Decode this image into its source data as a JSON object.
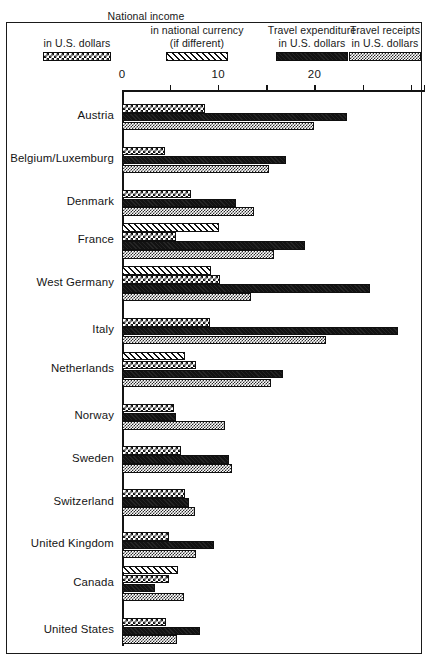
{
  "legend": [
    {
      "line1": "",
      "line2": "in U.S. dollars",
      "swatch": "income-swatch"
    },
    {
      "line1": "in national currency",
      "line2": "(if different)",
      "swatch": "currency-swatch"
    },
    {
      "line1": "Travel expenditure",
      "line2": "in U.S. dollars",
      "swatch": "expenditure-swatch"
    },
    {
      "line1": "Travel receipts",
      "line2": "in U.S. dollars",
      "swatch": "receipts-swatch"
    }
  ],
  "legend_title": "National income",
  "chart_data": {
    "type": "bar",
    "orientation": "horizontal",
    "title": "National income",
    "xlabel": "",
    "ylabel": "",
    "xlim": [
      0,
      31.5
    ],
    "grid": false,
    "legend_position": "top",
    "ticks": [
      0,
      5,
      10,
      15,
      20,
      25,
      30
    ],
    "tick_labels": [
      "0",
      "",
      "10",
      "",
      "20",
      "",
      ""
    ],
    "series": [
      {
        "name": "National income in U.S. dollars",
        "key": "income",
        "pattern": "checker-coarse"
      },
      {
        "name": "National income in national currency (if different)",
        "key": "currency",
        "pattern": "diagonal-hatch"
      },
      {
        "name": "Travel expenditure in U.S. dollars",
        "key": "expenditure",
        "pattern": "solid-black"
      },
      {
        "name": "Travel receipts in U.S. dollars",
        "key": "receipts",
        "pattern": "checker-fine"
      }
    ],
    "categories": [
      "Austria",
      "Belgium/Luxemburg",
      "Denmark",
      "France",
      "West Germany",
      "Italy",
      "Netherlands",
      "Norway",
      "Sweden",
      "Switzerland",
      "United Kingdom",
      "Canada",
      "United States"
    ],
    "rows": [
      {
        "category": "Austria",
        "currency": null,
        "income": 8.6,
        "expenditure": 23.4,
        "receipts": 20.0
      },
      {
        "category": "Belgium/Luxemburg",
        "currency": null,
        "income": 4.5,
        "expenditure": 17.0,
        "receipts": 15.3
      },
      {
        "category": "Denmark",
        "currency": null,
        "income": 7.2,
        "expenditure": 11.8,
        "receipts": 13.7
      },
      {
        "category": "France",
        "currency": 10.1,
        "income": 5.6,
        "expenditure": 19.0,
        "receipts": 15.8
      },
      {
        "category": "West Germany",
        "currency": 9.2,
        "income": 10.2,
        "expenditure": 25.8,
        "receipts": 13.4
      },
      {
        "category": "Italy",
        "currency": null,
        "income": 9.1,
        "expenditure": 28.7,
        "receipts": 21.2
      },
      {
        "category": "Netherlands",
        "currency": 6.6,
        "income": 7.7,
        "expenditure": 16.7,
        "receipts": 15.5
      },
      {
        "category": "Norway",
        "currency": null,
        "income": 5.4,
        "expenditure": 5.6,
        "receipts": 10.7
      },
      {
        "category": "Sweden",
        "currency": null,
        "income": 6.1,
        "expenditure": 11.1,
        "receipts": 11.4
      },
      {
        "category": "Switzerland",
        "currency": null,
        "income": 6.6,
        "expenditure": 7.0,
        "receipts": 7.6
      },
      {
        "category": "United Kingdom",
        "currency": null,
        "income": 4.9,
        "expenditure": 9.6,
        "receipts": 7.7
      },
      {
        "category": "Canada",
        "currency": 5.8,
        "income": 4.9,
        "expenditure": 3.4,
        "receipts": 6.4
      },
      {
        "category": "United States",
        "currency": null,
        "income": 4.6,
        "expenditure": 8.1,
        "receipts": 5.7
      }
    ]
  }
}
